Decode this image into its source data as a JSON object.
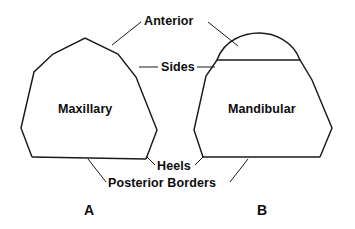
{
  "figure": {
    "background_color": "#ffffff",
    "line_color": "#1a1a1a",
    "width": 355,
    "height": 229
  },
  "callout_labels": {
    "anterior": "Anterior",
    "sides": "Sides",
    "heels": "Heels",
    "posterior_borders": "Posterior Borders"
  },
  "shapes": [
    {
      "id": "maxillary",
      "label": "Maxillary",
      "panel_letter": "A",
      "top_shape": "pointed-apex",
      "outline_points": "32,157 21,128 34,72 53,54 85,38 118,54 136,77 157,130 146,159"
    },
    {
      "id": "mandibular",
      "label": "Mandibular",
      "panel_letter": "B",
      "top_shape": "rounded-dome",
      "outline_points": "203,157 194,130 206,76 217,60 300,60 312,80 332,128 320,157",
      "dome_path": "M217,60 C224,40 244,33 259,33 C274,33 293,41 300,60"
    }
  ],
  "leaders": {
    "anterior_left": "140,22 112,45",
    "anterior_right": "208,22 237,45",
    "sides_left": "158,67 140,67",
    "sides_right": "196,67 214,67",
    "heels_left": "155,163 146,156",
    "heels_right": "196,163 205,156",
    "posterior_left": "106,181 88,158",
    "posterior_right": "229,181 247,158"
  }
}
